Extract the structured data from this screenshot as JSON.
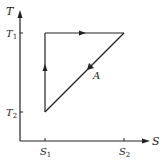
{
  "diagram": {
    "type": "T-S cycle",
    "axes": {
      "y_label": "T",
      "x_label": "S",
      "y_ticks": [
        {
          "base": "T",
          "sub": "1"
        },
        {
          "base": "T",
          "sub": "2"
        }
      ],
      "x_ticks": [
        {
          "base": "S",
          "sub": "1"
        },
        {
          "base": "S",
          "sub": "2"
        }
      ]
    },
    "cycle": {
      "vertices": [
        {
          "name": "(S1,T2)"
        },
        {
          "name": "(S1,T1)"
        },
        {
          "name": "(S2,T1)"
        }
      ],
      "path_label": "A",
      "direction": "S1T2 -> S1T1 -> S2T1 -> S1T2"
    },
    "colors": {
      "line": "#222222",
      "background": "#ffffff"
    }
  }
}
